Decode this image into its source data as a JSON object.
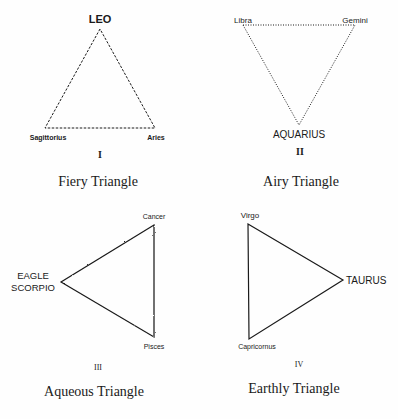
{
  "triangles": [
    {
      "id": "fiery",
      "numeral": "I",
      "title": "Fiery Triangle",
      "line_style": "dashed",
      "vertices": [
        {
          "label": "LEO",
          "x": 100,
          "y": 29
        },
        {
          "label": "Sagittorius",
          "x": 45,
          "y": 128
        },
        {
          "label": "Aries",
          "x": 155,
          "y": 128
        }
      ]
    },
    {
      "id": "airy",
      "numeral": "II",
      "title": "Airy Triangle",
      "line_style": "dotted",
      "vertices": [
        {
          "label": "Libra",
          "x": 243,
          "y": 25
        },
        {
          "label": "Gemini",
          "x": 355,
          "y": 25
        },
        {
          "label": "AQUARIUS",
          "x": 299,
          "y": 125
        }
      ]
    },
    {
      "id": "aqueous",
      "numeral": "III",
      "title": "Aqueous Triangle",
      "line_style": "wavy",
      "vertices": [
        {
          "label": "Cancer",
          "x": 154,
          "y": 225
        },
        {
          "label": "EAGLE",
          "label2": "SCORPIO",
          "x": 61,
          "y": 282
        },
        {
          "label": "Pisces",
          "x": 154,
          "y": 337
        }
      ]
    },
    {
      "id": "earthly",
      "numeral": "IV",
      "title": "Earthly Triangle",
      "line_style": "solid",
      "vertices": [
        {
          "label": "Virgo",
          "x": 248,
          "y": 224
        },
        {
          "label": "TAURUS",
          "x": 343,
          "y": 280
        },
        {
          "label": "Capricornus",
          "x": 249,
          "y": 339
        }
      ]
    }
  ],
  "colors": {
    "ink": "#1a1a1a",
    "background": "#fefefe"
  }
}
